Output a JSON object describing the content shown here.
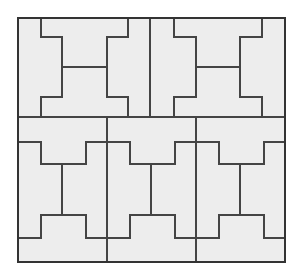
{
  "figure": {
    "canvas": {
      "width": 300,
      "height": 280
    },
    "frame": {
      "x": 18,
      "y": 18,
      "width": 267,
      "height": 244
    },
    "colors": {
      "background": "#ffffff",
      "tile_fill": "#ededed",
      "tile_stroke": "#444444",
      "frame_stroke": "#333333"
    },
    "stroke_widths": {
      "frame": 2,
      "cell_divider": 2,
      "tile_edge": 2
    },
    "cells": [
      {
        "name": "top-left",
        "orientation": "horizontal",
        "x": 18,
        "y": 18,
        "width": 110,
        "height": 99
      },
      {
        "name": "top-right",
        "orientation": "horizontal",
        "x": 151,
        "y": 18,
        "width": 134,
        "height": 99
      },
      {
        "name": "bottom-left",
        "orientation": "vertical",
        "x": 18,
        "y": 117,
        "width": 89,
        "height": 145
      },
      {
        "name": "bottom-middle",
        "orientation": "vertical",
        "x": 107,
        "y": 117,
        "width": 89,
        "height": 145
      },
      {
        "name": "bottom-right",
        "orientation": "vertical",
        "x": 196,
        "y": 117,
        "width": 89,
        "height": 145
      }
    ],
    "dividers": {
      "mid_horizontal_y": 117,
      "top_vertical_x": 150,
      "bottom_vertical_x": [
        107,
        196
      ]
    },
    "piece_count": 10,
    "labels": []
  }
}
